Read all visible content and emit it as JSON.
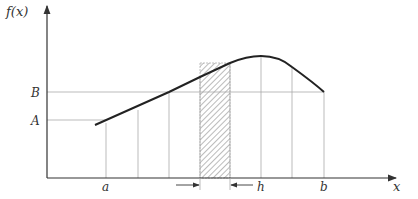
{
  "diagram": {
    "y_axis_label": "f(x)",
    "x_axis_label": "x",
    "y_ticks": [
      {
        "label": "B",
        "y": 92
      },
      {
        "label": "A",
        "y": 120
      }
    ],
    "x_ticks": [
      {
        "label": "a",
        "x": 106
      },
      {
        "label": "h",
        "x": 261
      },
      {
        "label": "b",
        "x": 324
      }
    ],
    "gridlines_x": [
      106,
      138,
      169,
      200,
      230,
      261,
      292,
      324
    ],
    "hatched_strip": {
      "x0": 200,
      "x1": 230,
      "top": 63
    },
    "width_arrow_label": "h",
    "colors": {
      "curve": "#222222",
      "axis": "#333333",
      "grid": "#aaaaaa",
      "hatch": "#555555"
    }
  }
}
